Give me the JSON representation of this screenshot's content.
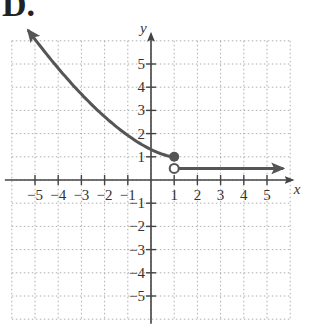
{
  "figure": {
    "label": "D."
  },
  "chart_data": {
    "type": "line",
    "title": "D.",
    "xlabel": "x",
    "ylabel": "y",
    "xlim": [
      -6,
      6
    ],
    "ylim": [
      -6,
      6
    ],
    "grid": true,
    "xticks": [
      -5,
      -4,
      -3,
      -2,
      -1,
      1,
      2,
      3,
      4,
      5
    ],
    "yticks": [
      -5,
      -4,
      -3,
      -2,
      -1,
      1,
      2,
      3,
      4,
      5
    ],
    "series": [
      {
        "name": "left piece (decreasing curve, x ≤ 1)",
        "x": [
          -5.3,
          -4,
          -3,
          -2,
          -1,
          0,
          1
        ],
        "y": [
          5.8,
          4.3,
          3.1,
          2.2,
          1.5,
          1.1,
          1.0
        ],
        "arrow_start": true,
        "endpoint": {
          "x": 1,
          "y": 1,
          "type": "closed"
        }
      },
      {
        "name": "right piece (constant, x > 1)",
        "x": [
          1,
          5.7
        ],
        "y": [
          0.5,
          0.5
        ],
        "arrow_end": true,
        "endpoint": {
          "x": 1,
          "y": 0.5,
          "type": "open"
        }
      }
    ],
    "color": "#555555"
  }
}
